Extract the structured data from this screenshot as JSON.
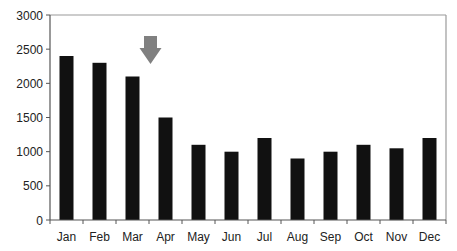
{
  "chart_data": {
    "type": "bar",
    "title": "",
    "xlabel": "",
    "ylabel": "",
    "categories": [
      "Jan",
      "Feb",
      "Mar",
      "Apr",
      "May",
      "Jun",
      "Jul",
      "Aug",
      "Sep",
      "Oct",
      "Nov",
      "Dec"
    ],
    "values": [
      2400,
      2300,
      2100,
      1500,
      1100,
      1000,
      1200,
      900,
      1000,
      1100,
      1050,
      1200
    ],
    "ylim": [
      0,
      3000
    ],
    "yticks": [
      0,
      500,
      1000,
      1500,
      2000,
      2500,
      3000
    ],
    "grid": false,
    "legend": null,
    "bar_color": "#111111",
    "annotations": [
      {
        "type": "arrow",
        "direction": "down",
        "position_between": [
          "Mar",
          "Apr"
        ],
        "color": "#808080"
      }
    ]
  },
  "colors": {
    "bar": "#111111",
    "axis": "#555555",
    "frame": "#9a9a9a",
    "arrow": "#808080",
    "text": "#222222"
  }
}
